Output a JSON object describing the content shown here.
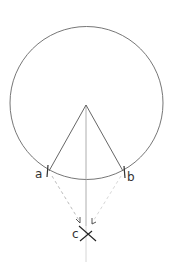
{
  "diagram": {
    "labels": {
      "a": "a",
      "b": "b",
      "c": "c"
    },
    "colors": {
      "stroke": "#555555",
      "dashed": "#aaaaaa",
      "axis": "#9a9a9a",
      "background": "#ffffff"
    }
  }
}
